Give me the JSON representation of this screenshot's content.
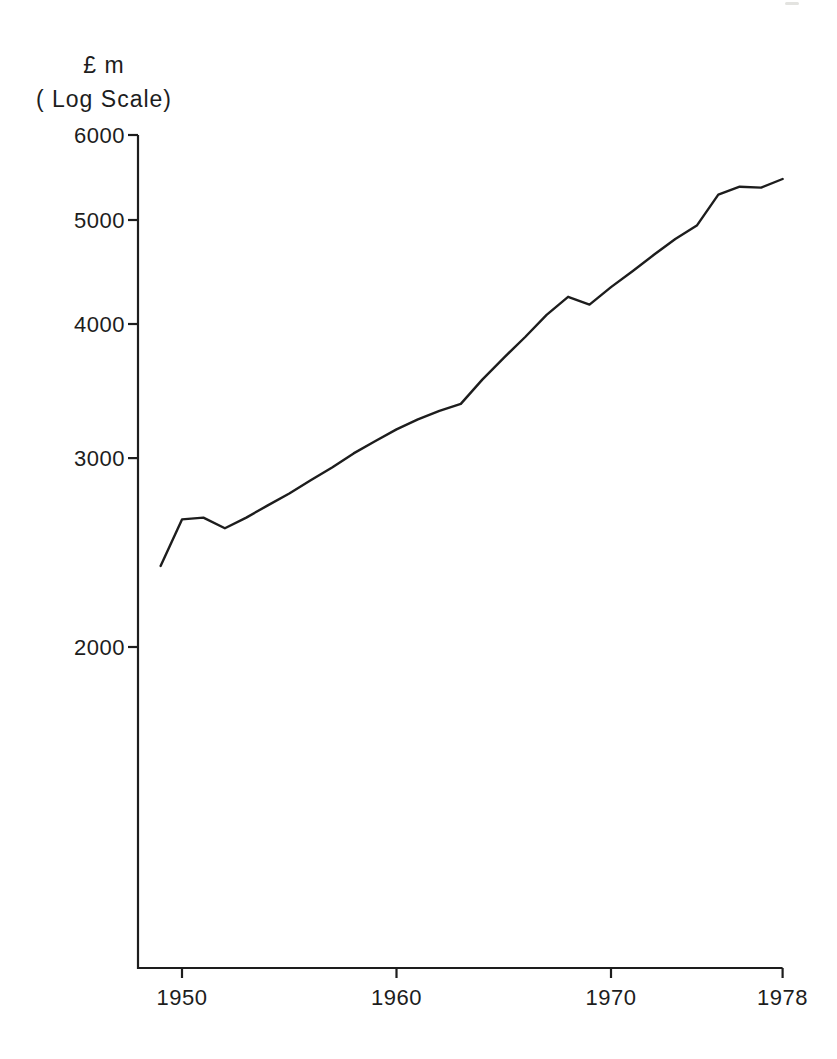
{
  "page": {
    "background": "#ffffff",
    "ink": "#1d1d1d"
  },
  "y_axis_title": {
    "line1": "£ m",
    "line2": "( Log Scale)"
  },
  "chart_data": {
    "type": "line",
    "title": "",
    "xlabel": "",
    "ylabel": "£ m ( Log Scale)",
    "y_scale": "log",
    "grid": false,
    "legend_position": "none",
    "ylim": [
      1000,
      6000
    ],
    "xlim": [
      1948,
      1978
    ],
    "y_ticks": [
      2000,
      3000,
      4000,
      5000,
      6000
    ],
    "x_ticks": [
      1950,
      1960,
      1970,
      1978
    ],
    "x": [
      1949,
      1950,
      1951,
      1952,
      1953,
      1954,
      1955,
      1956,
      1957,
      1958,
      1959,
      1960,
      1961,
      1962,
      1963,
      1964,
      1965,
      1966,
      1967,
      1968,
      1969,
      1970,
      1971,
      1972,
      1973,
      1974,
      1975,
      1976,
      1977,
      1978
    ],
    "values": [
      2380,
      2630,
      2640,
      2580,
      2640,
      2710,
      2780,
      2860,
      2940,
      3030,
      3110,
      3190,
      3260,
      3320,
      3370,
      3550,
      3720,
      3890,
      4080,
      4240,
      4170,
      4330,
      4480,
      4640,
      4800,
      4940,
      5280,
      5370,
      5360,
      5460
    ]
  }
}
